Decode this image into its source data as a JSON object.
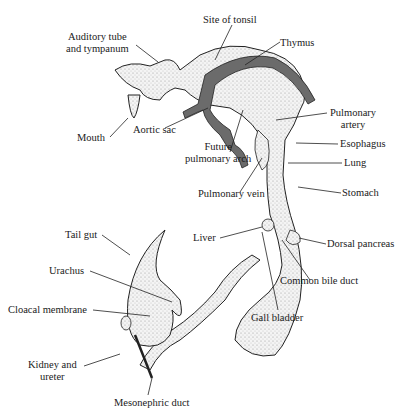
{
  "diagram": {
    "stroke_color": "#222222",
    "vessel_fill": "#6b6b6b",
    "tissue_fill": "#eeeeee",
    "labels": {
      "auditory_tube_1": "Auditory tube",
      "auditory_tube_2": "and tympanum",
      "site_of_tonsil": "Site of tonsil",
      "thymus": "Thymus",
      "mouth": "Mouth",
      "aortic_sac": "Aortic sac",
      "future_pulmonary_arch_1": "Future",
      "future_pulmonary_arch_2": "pulmonary arch",
      "pulmonary_artery_1": "Pulmonary",
      "pulmonary_artery_2": "artery",
      "esophagus": "Esophagus",
      "lung": "Lung",
      "pulmonary_vein": "Pulmonary vein",
      "stomach": "Stomach",
      "liver": "Liver",
      "dorsal_pancreas": "Dorsal pancreas",
      "common_bile_duct": "Common bile duct",
      "gall_bladder": "Gall bladder",
      "tail_gut": "Tail gut",
      "urachus": "Urachus",
      "cloacal_membrane": "Cloacal membrane",
      "kidney_ureter_1": "Kidney and",
      "kidney_ureter_2": "ureter",
      "mesonephric_duct": "Mesonephric duct"
    }
  }
}
